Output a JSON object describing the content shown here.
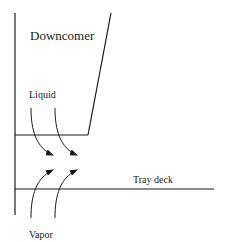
{
  "diagram": {
    "labels": {
      "downcomer": "Downcomer",
      "liquid": "Liquid",
      "vapor": "Vapor",
      "tray_deck": "Tray deck"
    },
    "colors": {
      "line": "#1a1a1a",
      "background": "#ffffff"
    }
  }
}
